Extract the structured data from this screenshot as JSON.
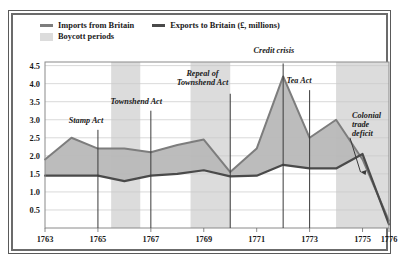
{
  "figure": {
    "frame_color": "#5a5a5a",
    "background": "#ffffff"
  },
  "legend": {
    "entries": [
      {
        "label": "Imports from Britain",
        "type": "line",
        "color": "#7d7d7d",
        "icon": "line-swatch-icon"
      },
      {
        "label": "Exports to Britain (£, millions)",
        "type": "line",
        "color": "#4a4a4a",
        "icon": "line-swatch-icon"
      },
      {
        "label": "Boycott periods",
        "type": "band",
        "color": "#dcdcdc",
        "icon": "band-swatch-icon"
      }
    ]
  },
  "chart_data": {
    "type": "line",
    "title": "",
    "subtitle": "",
    "xlabel": "",
    "ylabel": "",
    "unit": "£, millions",
    "x": [
      1763,
      1764,
      1765,
      1766,
      1767,
      1768,
      1769,
      1770,
      1771,
      1772,
      1773,
      1774,
      1775,
      1776
    ],
    "xlim": [
      1763,
      1776
    ],
    "ylim": [
      0,
      4.6
    ],
    "yticks": [
      0.5,
      1.0,
      1.5,
      2.0,
      2.5,
      3.0,
      3.5,
      4.0,
      4.5
    ],
    "ytick_labels": [
      "0.5",
      "1.0",
      "1.5",
      "2.0",
      "2.5",
      "3.0",
      "3.5",
      "4.0",
      "4.5"
    ],
    "xticks": [
      1763,
      1765,
      1767,
      1769,
      1771,
      1773,
      1775,
      1776
    ],
    "xtick_labels": [
      "1763",
      "1765",
      "1767",
      "1769",
      "1771",
      "1773",
      "1775",
      "1776"
    ],
    "grid": true,
    "grid_axis": "y",
    "legend_position": "top-left",
    "series": [
      {
        "name": "Imports from Britain",
        "color": "#7d7d7d",
        "values": [
          1.9,
          2.5,
          2.2,
          2.2,
          2.1,
          2.3,
          2.45,
          1.55,
          2.2,
          4.2,
          2.5,
          3.0,
          1.9,
          0.2
        ]
      },
      {
        "name": "Exports to Britain (£, millions)",
        "color": "#4a4a4a",
        "values": [
          1.45,
          1.45,
          1.45,
          1.3,
          1.45,
          1.5,
          1.6,
          1.43,
          1.45,
          1.75,
          1.65,
          1.65,
          2.05,
          0.1
        ]
      }
    ],
    "fill_between": {
      "upper": "Imports from Britain",
      "lower": "Exports to Britain (£, millions)",
      "color": "#b8b8b8"
    },
    "bands": [
      {
        "label": "Boycott periods",
        "start": 1765.5,
        "end": 1766.6,
        "color": "#dcdcdc"
      },
      {
        "label": "Boycott periods",
        "start": 1768.5,
        "end": 1770.0,
        "color": "#dcdcdc"
      },
      {
        "label": "Boycott periods",
        "start": 1774.0,
        "end": 1776.0,
        "color": "#dcdcdc"
      }
    ],
    "annotations": [
      {
        "text": "Stamp Act",
        "x": 1765,
        "label_x": 1764.55,
        "label_y": 2.92,
        "line_top": 2.72,
        "line_bottom": 0.0,
        "lines": [
          "Stamp Act"
        ]
      },
      {
        "text": "Townshend Act",
        "x": 1767,
        "label_x": 1766.45,
        "label_y": 3.45,
        "line_top": 3.25,
        "line_bottom": 0.0,
        "lines": [
          "Townshend Act"
        ]
      },
      {
        "text": "Repeal of Townshend Act",
        "x": 1770,
        "label_x": 1768.95,
        "label_y": 4.22,
        "line_top": 3.72,
        "line_bottom": 0.0,
        "lines": [
          "Repeal of",
          "Townshend Act"
        ]
      },
      {
        "text": "Credit crisis",
        "x": 1772,
        "label_x": 1771.65,
        "label_y": 4.85,
        "line_top": 4.56,
        "line_bottom": 0.0,
        "lines": [
          "Credit crisis"
        ]
      },
      {
        "text": "Tea Act",
        "x": 1773,
        "label_x": 1772.6,
        "label_y": 4.02,
        "line_top": 3.82,
        "line_bottom": 0.0,
        "lines": [
          "Tea Act"
        ]
      },
      {
        "text": "Colonial trade deficit",
        "x": 1775,
        "label_x": 1774.6,
        "label_y": 3.05,
        "lines": [
          "Colonial",
          "trade",
          "deficit"
        ],
        "arrow": true
      }
    ]
  }
}
